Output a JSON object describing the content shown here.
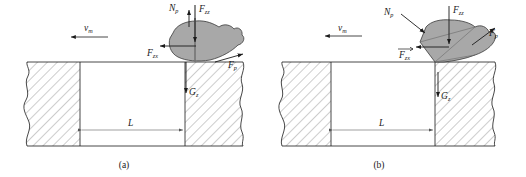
{
  "figure": {
    "panels": [
      {
        "id": "a",
        "caption": "(a)",
        "velocity_label": "v",
        "velocity_sub": "m",
        "dimension_label": "L",
        "forces": [
          {
            "name": "Np",
            "base": "N",
            "sub": "p",
            "direction": "up"
          },
          {
            "name": "Fzz",
            "base": "F",
            "sub": "zz",
            "direction": "down"
          },
          {
            "name": "Fzx",
            "base": "F",
            "sub": "zx",
            "direction": "left"
          },
          {
            "name": "Fp",
            "base": "F",
            "sub": "p",
            "direction": "up-right"
          },
          {
            "name": "Gz",
            "base": "G",
            "sub": "z",
            "direction": "down"
          }
        ],
        "rock_shape": "rounded-blob",
        "rock_position": "on-surface"
      },
      {
        "id": "b",
        "caption": "(b)",
        "velocity_label": "v",
        "velocity_sub": "m",
        "dimension_label": "L",
        "forces": [
          {
            "name": "Np",
            "base": "N",
            "sub": "p",
            "direction": "down-right"
          },
          {
            "name": "Fzz",
            "base": "F",
            "sub": "zz",
            "direction": "down"
          },
          {
            "name": "Fzx",
            "base": "F",
            "sub": "zx",
            "direction": "left",
            "vector": true
          },
          {
            "name": "Fp",
            "base": "F",
            "sub": "p",
            "direction": "up-right"
          },
          {
            "name": "Gz",
            "base": "G",
            "sub": "z",
            "direction": "down"
          }
        ],
        "rock_shape": "angular-faceted",
        "rock_position": "corner-edge"
      }
    ]
  },
  "colors": {
    "line": "#1a1a1a",
    "hatch": "#555555",
    "rock_fill": "#a8a8a8",
    "rock_stroke": "#3a3a3a",
    "background": "#ffffff",
    "dimension_line": "#777777"
  }
}
